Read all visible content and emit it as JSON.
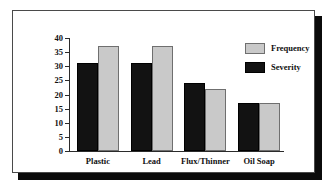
{
  "chart_data": {
    "type": "bar",
    "title": "",
    "xlabel": "",
    "ylabel": "",
    "ylim": [
      0,
      40
    ],
    "yticks": [
      0,
      5,
      10,
      15,
      20,
      25,
      30,
      35,
      40
    ],
    "grid": false,
    "legend_position": "top-right",
    "categories": [
      "Plastic",
      "Lead",
      "Flux/Thinner",
      "Oil Soap"
    ],
    "series": [
      {
        "name": "Severity",
        "color": "#121212",
        "values": [
          31,
          31,
          24,
          17
        ]
      },
      {
        "name": "Frequency",
        "color": "#c9c9c9",
        "values": [
          37,
          37,
          22,
          17
        ]
      }
    ]
  },
  "legend": {
    "entries": [
      {
        "label": "Frequency",
        "swatch": "frequency"
      },
      {
        "label": "Severity",
        "swatch": "severity"
      }
    ]
  },
  "colors": {
    "severity": "#121212",
    "frequency": "#c9c9c9",
    "axis": "#2b2b2b",
    "frame_border": "#4a4a4a",
    "frame_shadow": "#0b0b0b",
    "background": "#ffffff"
  }
}
